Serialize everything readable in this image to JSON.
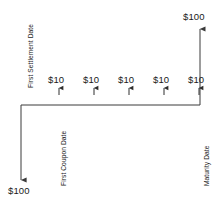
{
  "diagram": {
    "type": "bond-cash-flow-timeline",
    "stroke_color": "#3a3a3a",
    "text_color": "#1a1a1a",
    "background": "#ffffff",
    "timeline": {
      "baseline_y": 105,
      "x_start": 21,
      "x_end": 200
    },
    "initial_outflow": {
      "label": "$100",
      "direction": "down",
      "x": 21,
      "arrow_tip_y": 180,
      "label_x": 8,
      "label_y": 186
    },
    "final_inflow": {
      "label": "$100",
      "direction": "up",
      "x": 200,
      "arrow_tip_y": 28,
      "label_x": 183,
      "label_y": 12
    },
    "coupons": {
      "label": "$10",
      "direction": "up",
      "count": 5,
      "label_y": 75,
      "arrow_tip_y": 87,
      "arrow_base_y": 95,
      "items": [
        {
          "label": "$10",
          "x": 59
        },
        {
          "label": "$10",
          "x": 94
        },
        {
          "label": "$10",
          "x": 129
        },
        {
          "label": "$10",
          "x": 164
        },
        {
          "label": "$10",
          "x": 199
        }
      ]
    },
    "annotations": [
      {
        "name": "first-settlement-date",
        "text": "First Settlement Date",
        "orientation": "vertical-rotated-90ccw",
        "x": 28,
        "y": 88
      },
      {
        "name": "first-coupon-date",
        "text": "First Coupon Date",
        "orientation": "vertical-rotated-90ccw",
        "x": 61,
        "y": 186
      },
      {
        "name": "maturity-date",
        "text": "Maturity Date",
        "orientation": "vertical-rotated-90ccw",
        "x": 204,
        "y": 186
      }
    ]
  }
}
